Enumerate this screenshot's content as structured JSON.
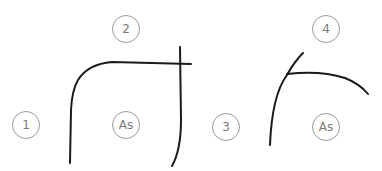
{
  "diagram": {
    "panels": [
      {
        "labels": [
          {
            "id": "1",
            "text": "1",
            "x": 26,
            "y": 125
          },
          {
            "id": "2",
            "text": "2",
            "x": 126,
            "y": 29
          },
          {
            "id": "as",
            "text": "As",
            "x": 126,
            "y": 125
          }
        ]
      },
      {
        "labels": [
          {
            "id": "3",
            "text": "3",
            "x": 226,
            "y": 127
          },
          {
            "id": "4",
            "text": "4",
            "x": 326,
            "y": 29
          },
          {
            "id": "as",
            "text": "As",
            "x": 326,
            "y": 127
          }
        ]
      }
    ],
    "stroke_color": "#1a1a1a",
    "circle_border_color": "#9a9a9a"
  }
}
